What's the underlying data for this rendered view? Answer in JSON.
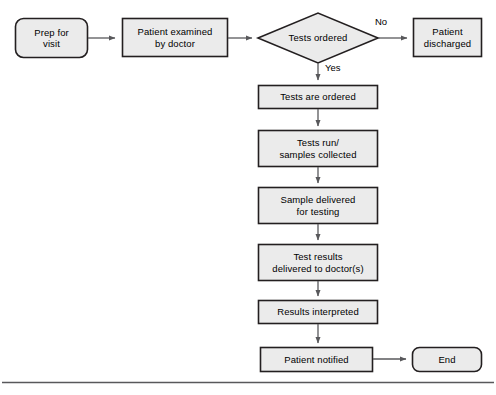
{
  "diagram": {
    "colors": {
      "shape_fill": "#ebebeb",
      "shape_stroke": "#231f20",
      "connector": "#58585b",
      "background": "#ffffff",
      "rule": "#58585b"
    },
    "nodes": [
      {
        "id": "prep-for-visit",
        "label": "Prep for\nvisit",
        "shape": "rounded-rectangle",
        "x": 15,
        "y": 18,
        "w": 73,
        "h": 40
      },
      {
        "id": "patient-examined-by-doctor",
        "label": "Patient examined\nby doctor",
        "shape": "rectangle",
        "x": 122,
        "y": 18,
        "w": 106,
        "h": 39
      },
      {
        "id": "tests-ordered",
        "label": "Tests ordered",
        "shape": "diamond",
        "x": 258,
        "y": 13,
        "w": 120,
        "h": 50
      },
      {
        "id": "patient-discharged",
        "label": "Patient\ndischarged",
        "shape": "rectangle",
        "x": 413,
        "y": 18,
        "w": 69,
        "h": 39
      },
      {
        "id": "tests-are-ordered",
        "label": "Tests are ordered",
        "shape": "rectangle",
        "x": 258,
        "y": 85,
        "w": 120,
        "h": 24
      },
      {
        "id": "tests-run-samples-collected",
        "label": "Tests run/\nsamples collected",
        "shape": "rectangle",
        "x": 258,
        "y": 130,
        "w": 120,
        "h": 37
      },
      {
        "id": "sample-delivered-for-testing",
        "label": "Sample delivered\nfor testing",
        "shape": "rectangle",
        "x": 258,
        "y": 187,
        "w": 120,
        "h": 37
      },
      {
        "id": "test-results-delivered-to-doctors",
        "label": "Test results\ndelivered to doctor(s)",
        "shape": "rectangle",
        "x": 258,
        "y": 244,
        "w": 120,
        "h": 37
      },
      {
        "id": "results-interpreted",
        "label": "Results interpreted",
        "shape": "rectangle",
        "x": 258,
        "y": 300,
        "w": 120,
        "h": 24
      },
      {
        "id": "patient-notified",
        "label": "Patient notified",
        "shape": "rectangle",
        "x": 260,
        "y": 347,
        "w": 113,
        "h": 25
      },
      {
        "id": "end",
        "label": "End",
        "shape": "rounded-rectangle",
        "x": 412,
        "y": 347,
        "w": 70,
        "h": 25
      }
    ],
    "edge_labels": [
      {
        "id": "branch-no",
        "text": "No",
        "x": 375,
        "y": 16
      },
      {
        "id": "branch-yes",
        "text": "Yes",
        "x": 325,
        "y": 62
      }
    ]
  }
}
